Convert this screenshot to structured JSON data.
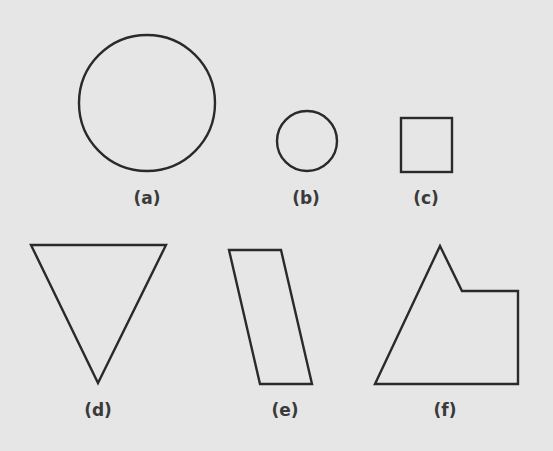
{
  "figure": {
    "background": "#e6e6e6",
    "stroke_color": "#2a2a2a",
    "shapes": [
      {
        "id": "a",
        "label": "(a)",
        "kind": "circle",
        "cx": 147,
        "cy": 103,
        "r": 68,
        "label_x": 147,
        "label_y": 190
      },
      {
        "id": "b",
        "label": "(b)",
        "kind": "circle",
        "cx": 307,
        "cy": 141,
        "r": 30,
        "label_x": 306,
        "label_y": 190
      },
      {
        "id": "c",
        "label": "(c)",
        "kind": "square",
        "x": 401,
        "y": 118,
        "w": 51,
        "h": 54,
        "label_x": 426,
        "label_y": 190
      },
      {
        "id": "d",
        "label": "(d)",
        "kind": "triangle",
        "points": "31,245 166,245 98,383",
        "label_x": 98,
        "label_y": 402
      },
      {
        "id": "e",
        "label": "(e)",
        "kind": "parallelogram",
        "points": "229,250 281,250 312,384 260,384",
        "label_x": 285,
        "label_y": 402
      },
      {
        "id": "f",
        "label": "(f)",
        "kind": "pentagon",
        "points": "375,384 440,246 462,291 518,291 518,384",
        "label_x": 445,
        "label_y": 402
      }
    ]
  }
}
